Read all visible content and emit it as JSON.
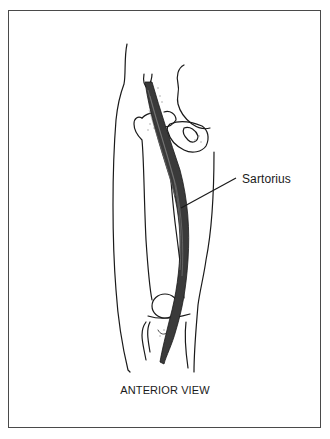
{
  "figure": {
    "labels": {
      "muscle": "Sartorius"
    },
    "caption": "ANTERIOR VIEW",
    "colors": {
      "frame": "#4a4a4a",
      "line": "#1a1a1a",
      "muscle_fill": "#3a3a3a",
      "stipple": "#9a9a9a"
    },
    "parts": [
      "thigh-outline",
      "pelvis",
      "femur",
      "femoral-head",
      "patella",
      "tibia",
      "sartorius-muscle",
      "leader-line"
    ]
  }
}
